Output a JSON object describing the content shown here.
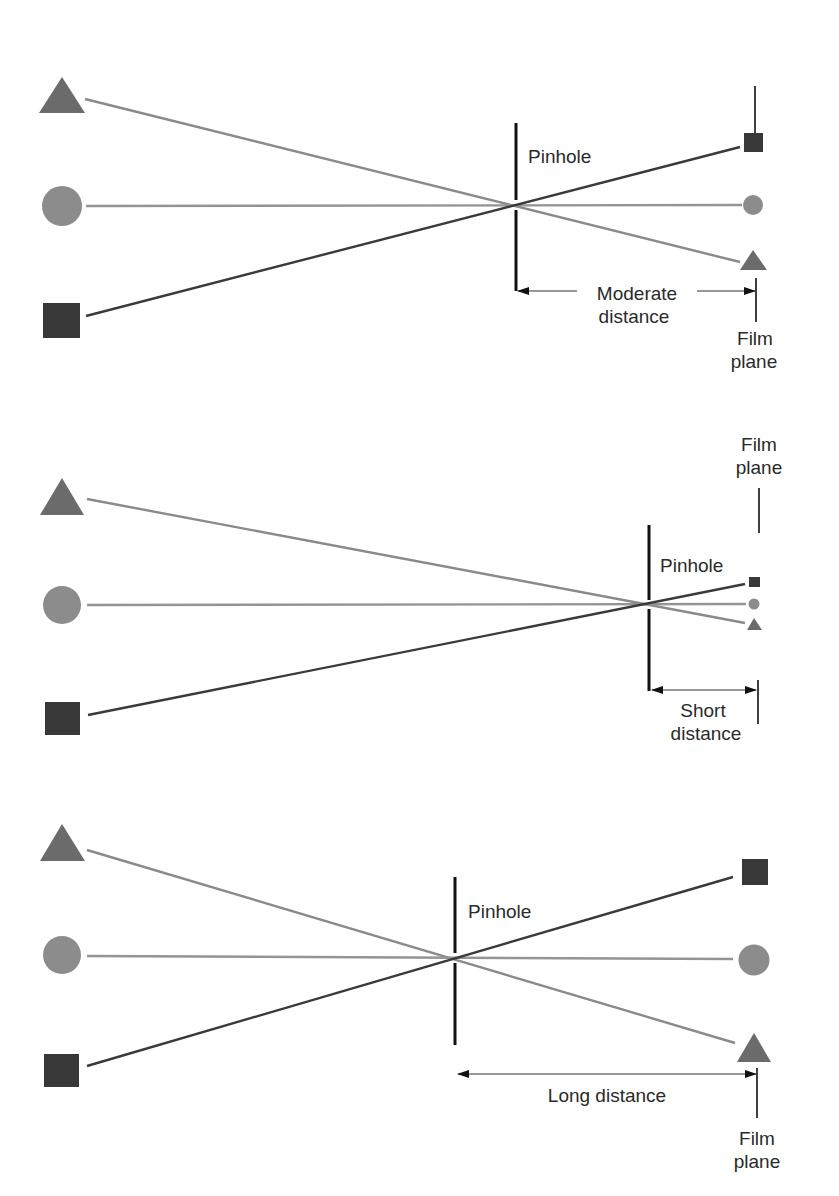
{
  "colors": {
    "triangle": "#6b6b6b",
    "circle": "#8c8c8c",
    "square": "#383838",
    "ray_triangle": "#8a8a8a",
    "ray_circle": "#949494",
    "ray_square": "#3a3a3a",
    "line": "#111111"
  },
  "panels": [
    {
      "id": "moderate",
      "pinhole_label": "Pinhole",
      "distance_label_line1": "Moderate",
      "distance_label_line2": "distance",
      "film_label_line1": "Film",
      "film_label_line2": "plane"
    },
    {
      "id": "short",
      "pinhole_label": "Pinhole",
      "distance_label_line1": "Short",
      "distance_label_line2": "distance",
      "film_label_line1": "Film",
      "film_label_line2": "plane"
    },
    {
      "id": "long",
      "pinhole_label": "Pinhole",
      "distance_label_line1": "Long distance",
      "distance_label_line2": "",
      "film_label_line1": "Film",
      "film_label_line2": "plane"
    }
  ],
  "objects": [
    "triangle",
    "circle",
    "square"
  ]
}
